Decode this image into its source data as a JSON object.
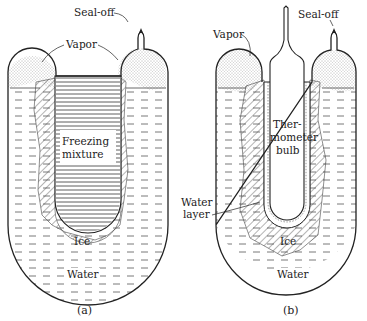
{
  "figure": {
    "panels": [
      {
        "id": "a",
        "caption": "(a)",
        "labels": {
          "seal_off": "Seal-off",
          "vapor": "Vapor",
          "inner": "Freezing",
          "inner2": "mixture",
          "ice": "Ice",
          "water": "Water"
        }
      },
      {
        "id": "b",
        "caption": "(b)",
        "labels": {
          "seal_off": "Seal-off",
          "vapor": "Vapor",
          "inner": "Ther-",
          "inner2": "mometer",
          "inner3": "bulb",
          "water_layer": "Water",
          "water_layer2": "layer",
          "ice": "Ice",
          "water": "Water"
        }
      }
    ]
  }
}
